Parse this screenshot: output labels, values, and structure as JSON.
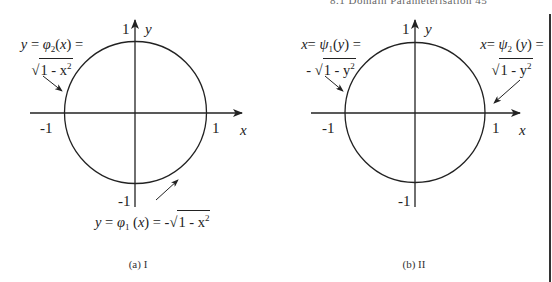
{
  "header": {
    "running_head": "8.1 Domain Parameterisation   45"
  },
  "colors": {
    "ink": "#222222",
    "background": "#ffffff"
  },
  "figures": [
    {
      "id": "a",
      "caption": "(a) I",
      "axes": {
        "x_label": "x",
        "y_label": "y",
        "x_tick_neg": "-1",
        "x_tick_pos": "1",
        "y_tick_pos": "1",
        "y_tick_neg": "-1"
      },
      "annotations": [
        {
          "position": "upper-left",
          "line1": "y = φ₂(x) =",
          "line2": "√1 - x²",
          "lhs_var": "y",
          "func": "φ",
          "func_sub": "2",
          "arg": "x",
          "sqrt_body": "1 - x",
          "sqrt_exp": "2",
          "sign": ""
        },
        {
          "position": "bottom",
          "line1": "y = φ₁(x) = -√1 - x²",
          "lhs_var": "y",
          "func": "φ",
          "func_sub": "1",
          "arg": "x",
          "sqrt_body": "1 - x",
          "sqrt_exp": "2",
          "sign": "-"
        }
      ]
    },
    {
      "id": "b",
      "caption": "(b) II",
      "axes": {
        "x_label": "x",
        "y_label": "y",
        "x_tick_neg": "-1",
        "x_tick_pos": "1",
        "y_tick_pos": "1",
        "y_tick_neg": "-1"
      },
      "annotations": [
        {
          "position": "upper-left",
          "line1": "x= ψ₁(y) =",
          "line2": "- √1 - y²",
          "lhs_var": "x",
          "func": "ψ",
          "func_sub": "1",
          "arg": "y",
          "sqrt_body": "1 - y",
          "sqrt_exp": "2",
          "sign": "-"
        },
        {
          "position": "upper-right",
          "line1": "x= ψ₂(y) =",
          "line2": "√1 - y²",
          "lhs_var": "x",
          "func": "ψ",
          "func_sub": "2",
          "arg": "y",
          "sqrt_body": "1 - y",
          "sqrt_exp": "2",
          "sign": ""
        }
      ]
    }
  ]
}
